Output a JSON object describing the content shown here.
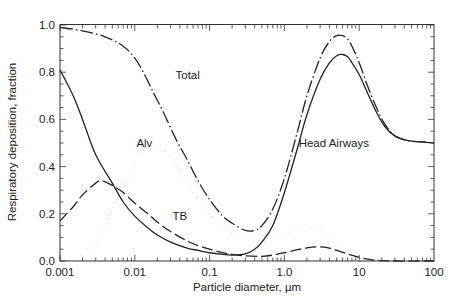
{
  "chart_data": {
    "type": "line",
    "title": "",
    "xlabel": "Particle diameter, µm",
    "ylabel": "Respiratory deposition, fraction",
    "xscale": "log",
    "xlim": [
      0.001,
      100
    ],
    "ylim": [
      0.0,
      1.0
    ],
    "grid": false,
    "legend": "none (inline curve labels)",
    "x_ticks": [
      {
        "value": 0.001,
        "label": "0.001"
      },
      {
        "value": 0.01,
        "label": "0.01"
      },
      {
        "value": 0.1,
        "label": "0.1"
      },
      {
        "value": 1,
        "label": "1.0"
      },
      {
        "value": 10,
        "label": "10"
      },
      {
        "value": 100,
        "label": "100"
      }
    ],
    "y_ticks": [
      {
        "value": 0.0,
        "label": "0.0"
      },
      {
        "value": 0.2,
        "label": "0.2"
      },
      {
        "value": 0.4,
        "label": "0.4"
      },
      {
        "value": 0.6,
        "label": "0.6"
      },
      {
        "value": 0.8,
        "label": "0.8"
      },
      {
        "value": 1.0,
        "label": "1.0"
      }
    ],
    "series": [
      {
        "name": "Total",
        "style": "dash-dot",
        "label": "Total",
        "x": [
          0.001,
          0.002,
          0.004,
          0.007,
          0.01,
          0.013,
          0.018,
          0.025,
          0.035,
          0.05,
          0.07,
          0.1,
          0.15,
          0.2,
          0.3,
          0.4,
          0.5,
          0.7,
          1.0,
          1.5,
          2.0,
          3.0,
          4.0,
          5.0,
          6.0,
          7.0,
          8.0,
          10,
          13,
          17,
          22,
          30,
          45,
          70,
          100
        ],
        "y": [
          0.99,
          0.975,
          0.95,
          0.91,
          0.86,
          0.8,
          0.71,
          0.62,
          0.52,
          0.43,
          0.34,
          0.26,
          0.19,
          0.16,
          0.13,
          0.13,
          0.15,
          0.22,
          0.35,
          0.55,
          0.7,
          0.86,
          0.93,
          0.955,
          0.955,
          0.94,
          0.91,
          0.84,
          0.74,
          0.65,
          0.58,
          0.53,
          0.51,
          0.505,
          0.5
        ]
      },
      {
        "name": "Head Airways",
        "style": "solid",
        "label": "Head Airways",
        "x": [
          0.001,
          0.0015,
          0.002,
          0.003,
          0.005,
          0.007,
          0.01,
          0.015,
          0.02,
          0.03,
          0.05,
          0.07,
          0.1,
          0.15,
          0.2,
          0.3,
          0.4,
          0.5,
          0.7,
          1.0,
          1.5,
          2.0,
          3.0,
          4.0,
          5.0,
          6.0,
          7.0,
          8.0,
          10,
          13,
          17,
          22,
          30,
          45,
          70,
          100
        ],
        "y": [
          0.81,
          0.7,
          0.6,
          0.45,
          0.33,
          0.25,
          0.19,
          0.14,
          0.11,
          0.08,
          0.055,
          0.045,
          0.035,
          0.028,
          0.025,
          0.03,
          0.05,
          0.08,
          0.15,
          0.29,
          0.48,
          0.62,
          0.77,
          0.84,
          0.87,
          0.875,
          0.865,
          0.84,
          0.79,
          0.71,
          0.63,
          0.57,
          0.53,
          0.51,
          0.505,
          0.5
        ]
      },
      {
        "name": "TB",
        "style": "dashed",
        "label": "TB",
        "x": [
          0.001,
          0.0015,
          0.002,
          0.003,
          0.0036,
          0.005,
          0.007,
          0.01,
          0.015,
          0.02,
          0.03,
          0.05,
          0.07,
          0.1,
          0.15,
          0.2,
          0.3,
          0.5,
          0.7,
          1.0,
          1.5,
          2.0,
          3.0,
          4.0,
          5.0,
          7.0,
          10,
          15,
          20,
          30,
          100
        ],
        "y": [
          0.17,
          0.23,
          0.28,
          0.33,
          0.34,
          0.32,
          0.29,
          0.245,
          0.2,
          0.165,
          0.125,
          0.085,
          0.065,
          0.05,
          0.035,
          0.028,
          0.022,
          0.02,
          0.025,
          0.035,
          0.048,
          0.056,
          0.06,
          0.055,
          0.045,
          0.03,
          0.015,
          0.005,
          0.002,
          0.0,
          0.0
        ]
      },
      {
        "name": "Alv",
        "style": "dotted",
        "label": "Alv",
        "x": [
          0.001,
          0.0015,
          0.002,
          0.003,
          0.004,
          0.005,
          0.007,
          0.01,
          0.013,
          0.017,
          0.022,
          0.03,
          0.04,
          0.05,
          0.07,
          0.1,
          0.15,
          0.2,
          0.3,
          0.5,
          0.7,
          1.0,
          1.5,
          2.0,
          3.0,
          4.0,
          5.0,
          7.0,
          10,
          15,
          20,
          100
        ],
        "y": [
          0.0,
          0.01,
          0.03,
          0.08,
          0.15,
          0.22,
          0.31,
          0.41,
          0.47,
          0.49,
          0.48,
          0.44,
          0.38,
          0.33,
          0.26,
          0.2,
          0.15,
          0.12,
          0.095,
          0.085,
          0.09,
          0.11,
          0.13,
          0.14,
          0.13,
          0.1,
          0.065,
          0.03,
          0.01,
          0.002,
          0.0,
          0.0
        ]
      }
    ],
    "annotations": [
      {
        "text": "Total",
        "x": 0.035,
        "y": 0.79
      },
      {
        "text": "Alv",
        "x": 0.0105,
        "y": 0.5
      },
      {
        "text": "TB",
        "x": 0.032,
        "y": 0.19
      },
      {
        "text": "Head Airways",
        "x": 1.55,
        "y": 0.5
      }
    ]
  }
}
